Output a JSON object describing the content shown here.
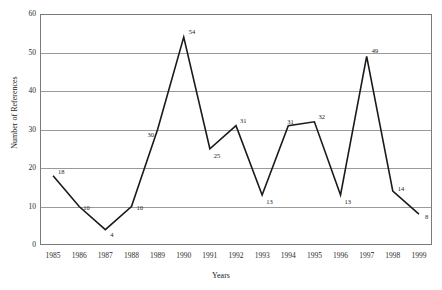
{
  "chart_data": {
    "type": "line",
    "title": "",
    "xlabel": "Years",
    "ylabel": "Number of References",
    "categories": [
      "1985",
      "1986",
      "1987",
      "1988",
      "1989",
      "1990",
      "1991",
      "1992",
      "1993",
      "1994",
      "1995",
      "1996",
      "1997",
      "1998",
      "1999"
    ],
    "values": [
      18,
      10,
      4,
      10,
      30,
      54,
      25,
      31,
      13,
      31,
      32,
      13,
      49,
      14,
      8
    ],
    "point_labels": [
      "18",
      "10",
      "4",
      "10",
      "30",
      "54",
      "25",
      "31",
      "13",
      "31",
      "32",
      "13",
      "49",
      "14",
      "8"
    ],
    "ylim": [
      0,
      60
    ],
    "yticks": [
      0,
      10,
      20,
      30,
      40,
      50,
      60
    ],
    "ytick_labels": [
      "0",
      "10",
      "20",
      "30",
      "40",
      "50",
      "60"
    ],
    "grid": true,
    "grid_axis": "y",
    "legend": false,
    "legend_position": "none",
    "series": [
      {
        "name": "Number of References",
        "values": [
          18,
          10,
          4,
          10,
          30,
          54,
          25,
          31,
          13,
          31,
          32,
          13,
          49,
          14,
          8
        ],
        "color": "#1a1a1a",
        "marker": "none",
        "line_width": 1.6
      }
    ],
    "colors": {
      "line": "#1a1a1a",
      "grid": "#9a9a9a",
      "frame": "#7a7a7a",
      "text": "#1a1a1a",
      "background": "#ffffff"
    }
  }
}
